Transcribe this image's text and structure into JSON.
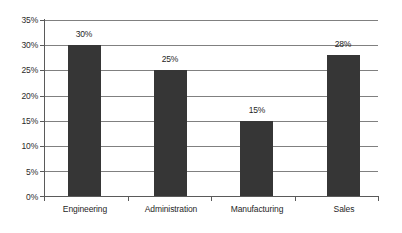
{
  "chart_data": {
    "type": "bar",
    "title": "",
    "subtitle": "",
    "xlabel": "",
    "ylabel": "",
    "categories": [
      "Engineering",
      "Administration",
      "Manufacturing",
      "Sales"
    ],
    "values": [
      30,
      25,
      15,
      28
    ],
    "value_labels": [
      "30%",
      "25%",
      "15%",
      "28%"
    ],
    "ylim": [
      0,
      35
    ],
    "ytick_values": [
      0,
      5,
      10,
      15,
      20,
      25,
      30,
      35
    ],
    "ytick_labels": [
      "0%",
      "5%",
      "10%",
      "15%",
      "20%",
      "25%",
      "30%",
      "35%"
    ],
    "grid": "horizontal",
    "legend": "none",
    "bar_color": "#363636",
    "grid_color": "#808080",
    "axis_color": "#5a5a5a",
    "background_color": "#ffffff",
    "text_color": "#1f1f1f"
  }
}
